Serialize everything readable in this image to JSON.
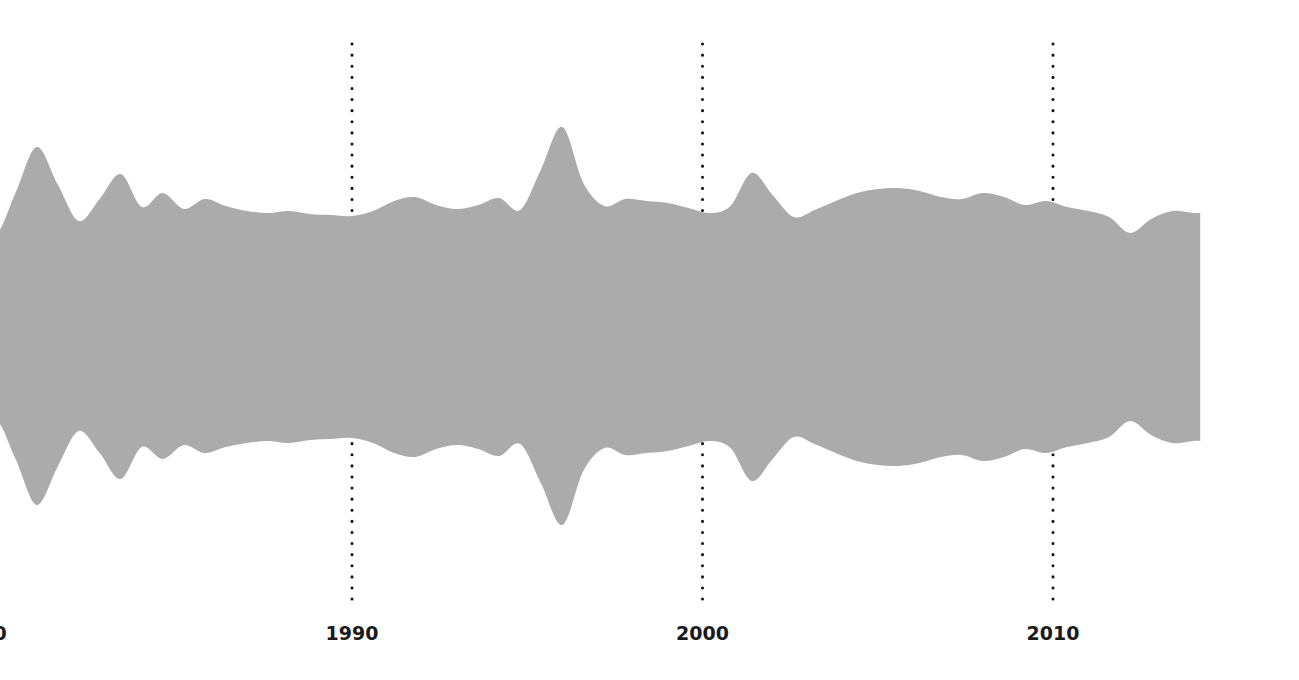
{
  "chart_data": {
    "type": "area",
    "title": "",
    "subtitle": "",
    "xlabel": "",
    "ylabel": "",
    "grid": true,
    "grid_style": "dotted-vertical",
    "legend": "none",
    "band_color": "#ababab",
    "background_color": "#ffffff",
    "gridline_color": "#111111",
    "axis_label_color": "#1a1a1a",
    "xlim": [
      1978.0,
      2014.2
    ],
    "ylim": [
      -3.4,
      3.4
    ],
    "x_tick_labels": [
      "80",
      "1990",
      "2000",
      "2010"
    ],
    "x_tick_values": [
      1980,
      1990,
      2000,
      2010
    ],
    "x_gridline_values": [
      1990,
      2000,
      2010
    ],
    "series": [
      {
        "name": "upper-bound",
        "x": [
          1978.0,
          1978.6,
          1979.2,
          1979.8,
          1980.4,
          1981.0,
          1981.6,
          1982.2,
          1982.8,
          1983.4,
          1984.0,
          1984.6,
          1985.2,
          1985.8,
          1986.4,
          1987.0,
          1987.6,
          1988.2,
          1988.8,
          1989.4,
          1990.0,
          1990.6,
          1991.2,
          1991.8,
          1992.4,
          1993.0,
          1993.6,
          1994.2,
          1994.8,
          1995.4,
          1996.0,
          1996.6,
          1997.2,
          1997.8,
          1998.4,
          1999.0,
          1999.6,
          2000.2,
          2000.8,
          2001.4,
          2002.0,
          2002.6,
          2003.2,
          2003.8,
          2004.4,
          2005.0,
          2005.6,
          2006.2,
          2006.8,
          2007.4,
          2008.0,
          2008.6,
          2009.2,
          2009.8,
          2010.4,
          2011.0,
          2011.6,
          2012.2,
          2012.8,
          2013.4,
          2014.0,
          2014.2
        ],
        "values": [
          1.95,
          2.26,
          1.52,
          0.96,
          1.36,
          1.82,
          1.45,
          1.08,
          1.3,
          1.55,
          1.22,
          1.36,
          1.2,
          1.3,
          1.23,
          1.18,
          1.16,
          1.18,
          1.15,
          1.14,
          1.13,
          1.18,
          1.28,
          1.32,
          1.24,
          1.2,
          1.24,
          1.31,
          1.19,
          1.6,
          2.02,
          1.46,
          1.23,
          1.3,
          1.28,
          1.26,
          1.21,
          1.16,
          1.23,
          1.56,
          1.34,
          1.12,
          1.19,
          1.28,
          1.36,
          1.4,
          1.41,
          1.38,
          1.32,
          1.3,
          1.36,
          1.32,
          1.24,
          1.28,
          1.22,
          1.18,
          1.12,
          0.96,
          1.1,
          1.18,
          1.16,
          1.16
        ]
      },
      {
        "name": "lower-bound",
        "x": [
          1978.0,
          1978.6,
          1979.2,
          1979.8,
          1980.4,
          1981.0,
          1981.6,
          1982.2,
          1982.8,
          1983.4,
          1984.0,
          1984.6,
          1985.2,
          1985.8,
          1986.4,
          1987.0,
          1987.6,
          1988.2,
          1988.8,
          1989.4,
          1990.0,
          1990.6,
          1991.2,
          1991.8,
          1992.4,
          1993.0,
          1993.6,
          1994.2,
          1994.8,
          1995.4,
          1996.0,
          1996.6,
          1997.2,
          1997.8,
          1998.4,
          1999.0,
          1999.6,
          2000.2,
          2000.8,
          2001.4,
          2002.0,
          2002.6,
          2003.2,
          2003.8,
          2004.4,
          2005.0,
          2005.6,
          2006.2,
          2006.8,
          2007.4,
          2008.0,
          2008.6,
          2009.2,
          2009.8,
          2010.4,
          2011.0,
          2011.6,
          2012.2,
          2012.8,
          2013.4,
          2014.0,
          2014.2
        ],
        "values": [
          -1.78,
          -2.14,
          -1.44,
          -0.92,
          -1.3,
          -1.76,
          -1.38,
          -1.02,
          -1.24,
          -1.5,
          -1.18,
          -1.3,
          -1.16,
          -1.24,
          -1.18,
          -1.14,
          -1.12,
          -1.14,
          -1.11,
          -1.1,
          -1.09,
          -1.14,
          -1.24,
          -1.28,
          -1.2,
          -1.16,
          -1.2,
          -1.27,
          -1.15,
          -1.55,
          -1.96,
          -1.42,
          -1.19,
          -1.26,
          -1.24,
          -1.22,
          -1.17,
          -1.12,
          -1.19,
          -1.52,
          -1.3,
          -1.08,
          -1.15,
          -1.24,
          -1.32,
          -1.36,
          -1.37,
          -1.34,
          -1.28,
          -1.26,
          -1.32,
          -1.28,
          -1.2,
          -1.24,
          -1.18,
          -1.14,
          -1.08,
          -0.92,
          -1.06,
          -1.14,
          -1.12,
          -1.12
        ]
      }
    ]
  },
  "axis": {
    "ticks": [
      {
        "label": "80",
        "value": 1980,
        "gridline": false
      },
      {
        "label": "1990",
        "value": 1990,
        "gridline": true
      },
      {
        "label": "2000",
        "value": 2000,
        "gridline": true
      },
      {
        "label": "2010",
        "value": 2010,
        "gridline": true
      }
    ]
  }
}
